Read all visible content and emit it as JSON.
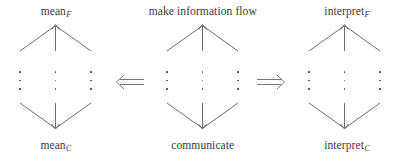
{
  "figure": {
    "stroke_color": "#555555",
    "text_color": "#3d3d3d",
    "background": "#ffffff"
  },
  "groups": [
    {
      "id": "mean",
      "x": 0,
      "width": 112,
      "top_label": {
        "base": "mean",
        "sub": "F"
      },
      "bottom_label": {
        "base": "mean",
        "sub": "C"
      },
      "branch_count": 3,
      "ellipsis_glyph": "⋮"
    },
    {
      "id": "make-information-flow",
      "x": 140,
      "width": 126,
      "top_label": {
        "base": "make information flow",
        "sub": ""
      },
      "bottom_label": {
        "base": "communicate",
        "sub": ""
      },
      "branch_count": 3,
      "ellipsis_glyph": "⋮"
    },
    {
      "id": "interpret",
      "x": 292,
      "width": 110,
      "top_label": {
        "base": "interpret",
        "sub": "F"
      },
      "bottom_label": {
        "base": "interpret",
        "sub": "C"
      },
      "branch_count": 3,
      "ellipsis_glyph": "⋮"
    }
  ],
  "connectors": [
    {
      "id": "left-implication",
      "direction": "left",
      "glyph": "⟸",
      "x": 112,
      "y": 73
    },
    {
      "id": "right-implication",
      "direction": "right",
      "glyph": "⟹",
      "x": 255,
      "y": 73
    }
  ]
}
